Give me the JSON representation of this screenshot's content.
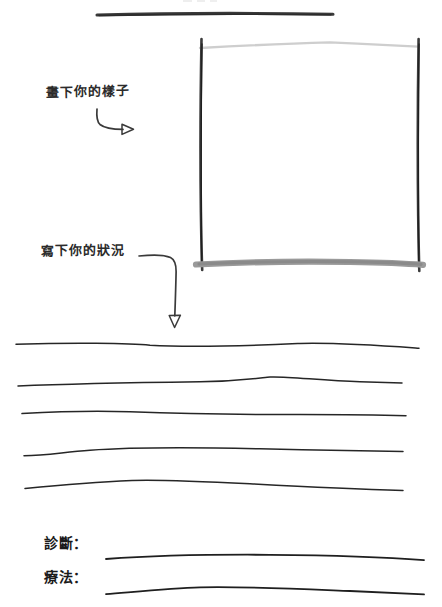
{
  "document": {
    "type": "worksheet",
    "background_color": "#ffffff",
    "ink_color": "#2b2b2b",
    "faint_ink_color": "#b9b9b9",
    "mid_ink_color": "#8d8d8d"
  },
  "top_rule": {
    "name": "top-divider-rule"
  },
  "portrait": {
    "instruction": "畫下你的樣子",
    "box_label": "portrait-drawing-box",
    "arrow_label": "arrow-to-portrait-box"
  },
  "condition": {
    "instruction": "寫下你的狀況",
    "arrow_label": "arrow-to-writing-lines",
    "writing_lines_count": 5
  },
  "fields": [
    {
      "label": "診斷：",
      "name": "diagnosis",
      "value": ""
    },
    {
      "label": "療法：",
      "name": "therapy",
      "value": ""
    }
  ]
}
